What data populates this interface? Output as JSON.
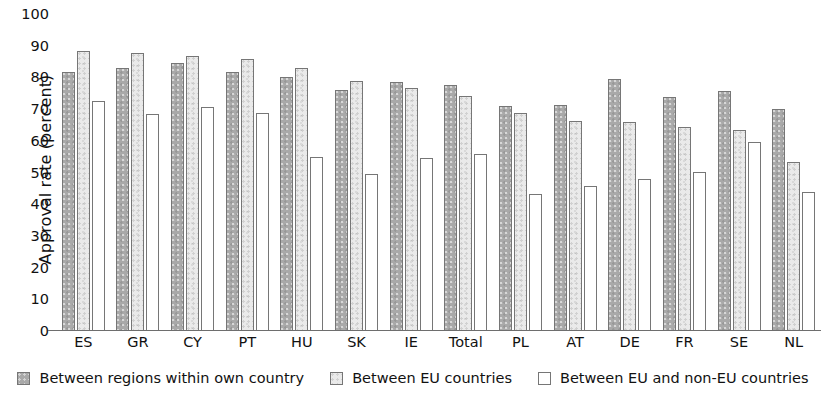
{
  "chart_data": {
    "type": "bar",
    "title": "",
    "xlabel": "",
    "ylabel": "Approval rate (percent)",
    "ylim": [
      0,
      100
    ],
    "ytick_step": 10,
    "yticks": [
      100,
      90,
      80,
      70,
      60,
      50,
      40,
      30,
      20,
      10,
      0
    ],
    "grid": false,
    "legend_position": "bottom",
    "categories": [
      "ES",
      "GR",
      "CY",
      "PT",
      "HU",
      "SK",
      "IE",
      "Total",
      "PL",
      "AT",
      "DE",
      "FR",
      "SE",
      "NL"
    ],
    "series": [
      {
        "name": "Between regions within own country",
        "color": "#a9a9a9",
        "values": [
          81.5,
          83.0,
          84.5,
          81.7,
          80.2,
          76.1,
          78.6,
          77.5,
          70.9,
          71.3,
          79.3,
          73.8,
          75.7,
          69.9
        ]
      },
      {
        "name": "Between EU countries",
        "color": "#eaeaea",
        "values": [
          88.3,
          87.8,
          86.6,
          85.9,
          83.0,
          78.9,
          76.6,
          74.2,
          68.6,
          66.2,
          65.9,
          64.1,
          63.2,
          53.3
        ]
      },
      {
        "name": "Between EU and non-EU countries",
        "color": "#ffffff",
        "values": [
          72.6,
          68.5,
          70.5,
          68.8,
          54.6,
          49.5,
          54.3,
          55.6,
          43.2,
          45.6,
          47.7,
          50.0,
          59.4,
          43.7
        ]
      }
    ]
  },
  "legend": {
    "items": [
      {
        "label": "Between regions within own country"
      },
      {
        "label": "Between EU countries"
      },
      {
        "label": "Between EU and non-EU countries"
      }
    ]
  }
}
